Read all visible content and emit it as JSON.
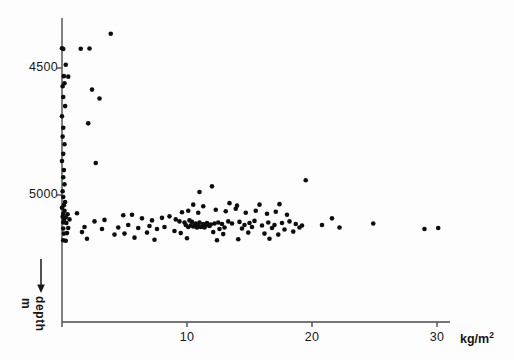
{
  "chart_data": {
    "type": "scatter",
    "title": "",
    "subtitle": "",
    "xlabel": "kg/m2",
    "xlabel_base": "kg/m",
    "xlabel_sup": "2",
    "ylabel": "depth",
    "yunit": "m",
    "y_axis_direction": "increasing downward",
    "y_arrow": "down-arrow",
    "grid": false,
    "legend": null,
    "xlim": [
      0,
      33.5
    ],
    "ylim": [
      4330,
      5215
    ],
    "xticks": [
      0,
      10,
      20,
      30
    ],
    "xtick_labels": [
      "",
      "10",
      "20",
      "30"
    ],
    "yticks": [
      4500,
      5000
    ],
    "ytick_labels": [
      "4500",
      "5000"
    ],
    "marker": "filled-circle",
    "marker_color": "#0d0d0d",
    "marker_size_px": 4.6,
    "axis_color": "#4a4a4a",
    "background": "#fdfdfd",
    "n_points": 150,
    "points": [
      [
        3.9,
        4365
      ],
      [
        0.0,
        4422
      ],
      [
        0.1,
        4425
      ],
      [
        1.5,
        4424
      ],
      [
        2.2,
        4423
      ],
      [
        0.3,
        4487
      ],
      [
        0.15,
        4532
      ],
      [
        0.5,
        4534
      ],
      [
        0.2,
        4560
      ],
      [
        0.05,
        4572
      ],
      [
        2.4,
        4585
      ],
      [
        0.1,
        4614
      ],
      [
        3.0,
        4620
      ],
      [
        0.25,
        4650
      ],
      [
        0.0,
        4690
      ],
      [
        2.1,
        4718
      ],
      [
        0.1,
        4735
      ],
      [
        0.05,
        4770
      ],
      [
        0.2,
        4800
      ],
      [
        0.1,
        4838
      ],
      [
        0.0,
        4866
      ],
      [
        2.7,
        4874
      ],
      [
        0.15,
        4902
      ],
      [
        0.1,
        4930
      ],
      [
        19.5,
        4942
      ],
      [
        0.2,
        4958
      ],
      [
        0.05,
        4985
      ],
      [
        11.0,
        4988
      ],
      [
        12.0,
        4966
      ],
      [
        0.1,
        5008
      ],
      [
        0.25,
        5028
      ],
      [
        0.15,
        5040
      ],
      [
        0.0,
        5050
      ],
      [
        0.2,
        5062
      ],
      [
        10.5,
        5038
      ],
      [
        11.3,
        5044
      ],
      [
        13.4,
        5032
      ],
      [
        14.0,
        5042
      ],
      [
        15.8,
        5038
      ],
      [
        17.4,
        5036
      ],
      [
        0.1,
        5074
      ],
      [
        0.45,
        5076
      ],
      [
        1.2,
        5072
      ],
      [
        0.05,
        5086
      ],
      [
        0.3,
        5088
      ],
      [
        0.15,
        5098
      ],
      [
        0.6,
        5096
      ],
      [
        4.9,
        5080
      ],
      [
        5.6,
        5078
      ],
      [
        9.6,
        5068
      ],
      [
        10.1,
        5062
      ],
      [
        10.9,
        5070
      ],
      [
        12.3,
        5058
      ],
      [
        13.1,
        5064
      ],
      [
        13.9,
        5054
      ],
      [
        14.7,
        5070
      ],
      [
        15.5,
        5062
      ],
      [
        16.4,
        5074
      ],
      [
        17.1,
        5066
      ],
      [
        18.0,
        5078
      ],
      [
        0.1,
        5108
      ],
      [
        0.35,
        5110
      ],
      [
        2.6,
        5104
      ],
      [
        3.4,
        5098
      ],
      [
        6.4,
        5092
      ],
      [
        7.2,
        5100
      ],
      [
        8.0,
        5090
      ],
      [
        8.6,
        5084
      ],
      [
        9.1,
        5096
      ],
      [
        9.4,
        5104
      ],
      [
        9.8,
        5108
      ],
      [
        10.2,
        5100
      ],
      [
        10.4,
        5106
      ],
      [
        10.7,
        5112
      ],
      [
        11.0,
        5108
      ],
      [
        11.3,
        5114
      ],
      [
        11.6,
        5110
      ],
      [
        11.9,
        5116
      ],
      [
        12.2,
        5112
      ],
      [
        12.5,
        5108
      ],
      [
        12.8,
        5114
      ],
      [
        9.9,
        5118
      ],
      [
        10.3,
        5120
      ],
      [
        10.6,
        5122
      ],
      [
        10.9,
        5118
      ],
      [
        11.2,
        5124
      ],
      [
        11.5,
        5120
      ],
      [
        11.8,
        5122
      ],
      [
        10.1,
        5126
      ],
      [
        10.5,
        5124
      ],
      [
        10.8,
        5128
      ],
      [
        11.1,
        5126
      ],
      [
        11.4,
        5128
      ],
      [
        13.3,
        5104
      ],
      [
        13.6,
        5112
      ],
      [
        14.2,
        5106
      ],
      [
        14.6,
        5118
      ],
      [
        15.0,
        5110
      ],
      [
        15.4,
        5102
      ],
      [
        16.0,
        5120
      ],
      [
        16.5,
        5108
      ],
      [
        17.0,
        5118
      ],
      [
        17.6,
        5110
      ],
      [
        18.2,
        5104
      ],
      [
        18.7,
        5114
      ],
      [
        19.2,
        5120
      ],
      [
        0.1,
        5132
      ],
      [
        0.5,
        5130
      ],
      [
        1.8,
        5126
      ],
      [
        3.2,
        5134
      ],
      [
        4.5,
        5128
      ],
      [
        5.3,
        5118
      ],
      [
        6.1,
        5130
      ],
      [
        7.0,
        5122
      ],
      [
        7.6,
        5134
      ],
      [
        8.2,
        5126
      ],
      [
        12.6,
        5134
      ],
      [
        13.0,
        5128
      ],
      [
        14.4,
        5132
      ],
      [
        15.2,
        5126
      ],
      [
        16.8,
        5130
      ],
      [
        17.8,
        5136
      ],
      [
        19.0,
        5128
      ],
      [
        0.15,
        5152
      ],
      [
        0.4,
        5150
      ],
      [
        1.6,
        5146
      ],
      [
        4.2,
        5156
      ],
      [
        5.0,
        5152
      ],
      [
        6.8,
        5148
      ],
      [
        9.0,
        5142
      ],
      [
        9.5,
        5150
      ],
      [
        12.1,
        5146
      ],
      [
        12.9,
        5154
      ],
      [
        14.9,
        5148
      ],
      [
        16.2,
        5152
      ],
      [
        17.3,
        5156
      ],
      [
        18.5,
        5144
      ],
      [
        0.1,
        5178
      ],
      [
        0.3,
        5180
      ],
      [
        2.0,
        5172
      ],
      [
        5.8,
        5168
      ],
      [
        7.4,
        5176
      ],
      [
        10.0,
        5170
      ],
      [
        12.4,
        5178
      ],
      [
        14.1,
        5174
      ],
      [
        16.6,
        5172
      ],
      [
        20.8,
        5118
      ],
      [
        21.6,
        5092
      ],
      [
        22.2,
        5128
      ],
      [
        24.9,
        5112
      ],
      [
        29.0,
        5134
      ],
      [
        30.1,
        5130
      ]
    ]
  },
  "axis_geometry": {
    "x_origin_px": 62,
    "y_origin_px": 322,
    "x_unit_px": 12.5,
    "y_top_px": 18,
    "y_4500_px": 68,
    "y_5000_px": 195
  }
}
